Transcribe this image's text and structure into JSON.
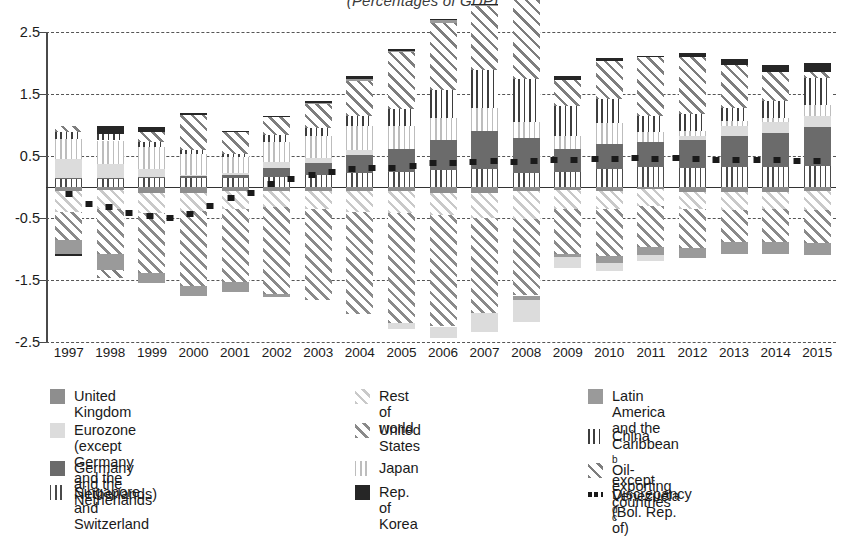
{
  "chart_data": {
    "type": "bar",
    "title": "(Percentages of GDP)",
    "xlabel": "",
    "ylabel": "",
    "ylim": [
      -2.5,
      2.5
    ],
    "yticks": [
      "2.5",
      "1.5",
      "0.5",
      "-0.5",
      "-1.5",
      "-2.5"
    ],
    "ytick_values": [
      2.5,
      1.5,
      0.5,
      -0.5,
      -1.5,
      -2.5
    ],
    "grid": true,
    "stacked": true,
    "legend_position": "bottom",
    "categories": [
      "1997",
      "1998",
      "1999",
      "2000",
      "2001",
      "2002",
      "2003",
      "2004",
      "2005",
      "2006",
      "2007",
      "2008",
      "2009",
      "2010",
      "2011",
      "2012",
      "2013",
      "2014",
      "2015"
    ],
    "series": [
      {
        "name": "United Kingdom",
        "pattern": "solid-medium-gray",
        "color": "#8e8e8e",
        "values": [
          -0.06,
          -0.05,
          -0.09,
          -0.09,
          -0.07,
          -0.07,
          -0.06,
          -0.07,
          -0.06,
          -0.09,
          -0.09,
          -0.06,
          -0.05,
          -0.06,
          -0.03,
          -0.08,
          -0.08,
          -0.08,
          -0.07
        ]
      },
      {
        "name": "Eurozone (except Germany\nand the Netherlands)",
        "pattern": "solid-light-gray",
        "color": "#dcdcdc",
        "values": [
          0.3,
          0.22,
          0.13,
          0.02,
          0.03,
          0.09,
          0.08,
          0.08,
          -0.09,
          -0.19,
          -0.3,
          -0.36,
          -0.17,
          -0.13,
          -0.09,
          0.06,
          0.16,
          0.18,
          0.18
        ]
      },
      {
        "name": "Germany and the Netherlands",
        "pattern": "solid-dark-gray",
        "color": "#6b6b6b",
        "values": [
          0.02,
          0.02,
          0.02,
          0.04,
          0.06,
          0.15,
          0.19,
          0.3,
          0.38,
          0.49,
          0.61,
          0.57,
          0.38,
          0.41,
          0.4,
          0.46,
          0.5,
          0.54,
          0.62
        ]
      },
      {
        "name": "Singapore and Switzerland",
        "pattern": "vertical-lines-dark",
        "color": "#4a4a4a",
        "values": [
          0.13,
          0.13,
          0.14,
          0.14,
          0.14,
          0.16,
          0.2,
          0.22,
          0.24,
          0.27,
          0.29,
          0.22,
          0.24,
          0.29,
          0.32,
          0.3,
          0.33,
          0.33,
          0.34
        ]
      },
      {
        "name": "Rest of world",
        "pattern": "diagonal-hatch-light",
        "color": "#c9c9c9",
        "values": [
          -0.34,
          -0.3,
          -0.33,
          -0.29,
          -0.28,
          -0.26,
          -0.29,
          -0.34,
          -0.36,
          -0.36,
          -0.41,
          -0.46,
          -0.3,
          -0.3,
          -0.28,
          -0.28,
          -0.29,
          -0.28,
          -0.3
        ]
      },
      {
        "name": "United States",
        "pattern": "diagonal-hatch-dark",
        "color": "#8a8a8a",
        "values": [
          -0.46,
          -0.73,
          -0.96,
          -1.22,
          -1.19,
          -1.39,
          -1.48,
          -1.64,
          -1.78,
          -1.8,
          -1.54,
          -1.23,
          -0.73,
          -0.76,
          -0.65,
          -0.62,
          -0.51,
          -0.53,
          -0.54
        ]
      },
      {
        "name": "Japan",
        "pattern": "vertical-lines-light",
        "color": "#bdbdbd",
        "values": [
          0.32,
          0.38,
          0.36,
          0.33,
          0.25,
          0.33,
          0.36,
          0.38,
          0.36,
          0.36,
          0.37,
          0.26,
          0.2,
          0.33,
          0.17,
          0.09,
          0.08,
          0.06,
          0.18
        ]
      },
      {
        "name": "Rep. of Korea",
        "pattern": "solid-black",
        "color": "#262626",
        "values": [
          -0.03,
          0.13,
          0.08,
          0.04,
          0.02,
          0.02,
          0.03,
          0.05,
          0.03,
          0.01,
          0.02,
          0.0,
          0.06,
          0.04,
          0.03,
          0.06,
          0.1,
          0.11,
          0.14
        ]
      },
      {
        "name": "Latin America and the Caribbean <sup>b</sup>\nexcept Venezuela (Bol. Rep. of)",
        "pattern": "solid-gray",
        "color": "#9a9a9a",
        "values": [
          -0.22,
          -0.26,
          -0.17,
          -0.16,
          -0.16,
          -0.05,
          0.01,
          0.03,
          0.03,
          0.05,
          0.01,
          -0.07,
          -0.05,
          -0.11,
          -0.14,
          -0.16,
          -0.2,
          -0.19,
          -0.19
        ]
      },
      {
        "name": "China",
        "pattern": "vertical-lines-china",
        "color": "#3d3d3d",
        "values": [
          0.12,
          0.11,
          0.07,
          0.06,
          0.06,
          0.11,
          0.12,
          0.17,
          0.28,
          0.45,
          0.62,
          0.69,
          0.48,
          0.39,
          0.25,
          0.26,
          0.2,
          0.27,
          0.44
        ]
      },
      {
        "name": "Oil-exporting countries <sup>c</sup>",
        "pattern": "diagonal-hatch-oil",
        "color": "#7e7e7e",
        "values": [
          0.09,
          -0.12,
          0.17,
          0.57,
          0.35,
          0.29,
          0.4,
          0.56,
          0.91,
          1.08,
          1.03,
          1.32,
          0.43,
          0.62,
          0.95,
          0.93,
          0.7,
          0.48,
          0.1
        ]
      }
    ],
    "discrepancy": {
      "name": "Discrepancy <sup>d</sup>",
      "style": "dotted-line",
      "color": "#1a1a1a",
      "values": [
        -0.12,
        -0.27,
        -0.33,
        -0.42,
        -0.47,
        -0.5,
        -0.44,
        -0.3,
        -0.18,
        -0.1,
        0.05,
        0.13,
        0.2,
        0.24,
        0.29,
        0.3,
        0.31,
        0.34,
        0.38,
        0.39,
        0.4,
        0.42,
        0.41,
        0.42,
        0.43,
        0.44,
        0.45,
        0.45,
        0.46,
        0.45,
        0.46,
        0.45,
        0.44,
        0.44,
        0.43,
        0.43,
        0.42,
        0.42
      ]
    },
    "legend": {
      "columns": [
        [
          {
            "label": "United Kingdom",
            "swatch": "p-uk",
            "icon": "legend-swatch-united-kingdom"
          },
          {
            "label": "Eurozone (except Germany\nand the Netherlands)",
            "swatch": "p-euro",
            "icon": "legend-swatch-eurozone"
          },
          {
            "label": "Germany and the Netherlands",
            "swatch": "p-gernl",
            "icon": "legend-swatch-germany-netherlands"
          },
          {
            "label": "Singapore and Switzerland",
            "swatch": "p-sgch",
            "icon": "legend-swatch-singapore-switzerland"
          }
        ],
        [
          {
            "label": "Rest of world",
            "swatch": "p-row",
            "icon": "legend-swatch-rest-of-world"
          },
          {
            "label": "United States",
            "swatch": "p-us",
            "icon": "legend-swatch-united-states"
          },
          {
            "label": "Japan",
            "swatch": "p-japan",
            "icon": "legend-swatch-japan"
          },
          {
            "label": "Rep. of Korea",
            "swatch": "p-korea",
            "icon": "legend-swatch-rep-of-korea"
          }
        ],
        [
          {
            "label": "Latin America and the Caribbean b\nexcept Venezuela (Bol. Rep. of)",
            "swatch": "p-lac",
            "icon": "legend-swatch-latin-america"
          },
          {
            "label": "China",
            "swatch": "p-china",
            "icon": "legend-swatch-china"
          },
          {
            "label": "Oil-exporting countries c",
            "swatch": "p-oil",
            "icon": "legend-swatch-oil-exporting"
          },
          {
            "label": "Discrepancy d",
            "swatch": "sw-disc",
            "icon": "legend-swatch-discrepancy"
          }
        ]
      ]
    }
  }
}
